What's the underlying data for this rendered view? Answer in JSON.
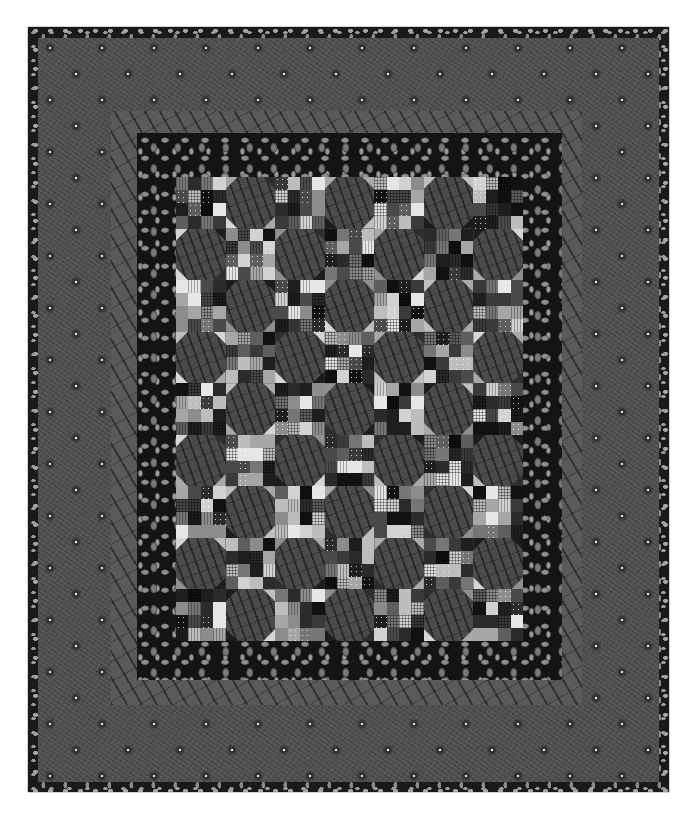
{
  "image": {
    "subject": "quilt",
    "description": "Scrappy patchwork quilt of alternating four-patch style blocks and snowball blocks, surrounded by a dark leaf-print border, a gray branch-print inner border, a wide gray paisley-dot outer border, and dark leaf-print binding",
    "colors": {
      "background": "#ffffff",
      "binding": "#1a1a1a",
      "outer_border": "#525252",
      "outer_border_dots": "#e4e4e4",
      "inner_border": "#5a5a5a",
      "leaf_border": "#141414",
      "snowball": "#4b4b4b"
    },
    "layout": {
      "grid_columns": 7,
      "grid_rows": 9
    },
    "blocks": [
      "P",
      "S",
      "P",
      "S",
      "P",
      "S",
      "P",
      "S",
      "P",
      "S",
      "P",
      "S",
      "P",
      "S",
      "P",
      "S",
      "P",
      "S",
      "P",
      "S",
      "P",
      "S",
      "P",
      "S",
      "P",
      "S",
      "P",
      "S",
      "P",
      "S",
      "P",
      "S",
      "P",
      "S",
      "P",
      "S",
      "P",
      "S",
      "P",
      "S",
      "P",
      "S",
      "P",
      "S",
      "P",
      "S",
      "P",
      "S",
      "P",
      "S",
      "P",
      "S",
      "P",
      "S",
      "P",
      "S",
      "P",
      "S",
      "P",
      "S",
      "P",
      "S",
      "P"
    ],
    "patch_palette": [
      "#111111",
      "#1e1e1e",
      "#2b2b2b",
      "#3a3a3a",
      "#4a4a4a",
      "#5e5e5e",
      "#767676",
      "#8c8c8c",
      "#a6a6a6",
      "#bdbdbd",
      "#d2d2d2",
      "#e6e6e6"
    ],
    "corner_palette": [
      "#bfbfbf",
      "#a9a9a9",
      "#d6d6d6",
      "#8f8f8f",
      "#1c1c1c",
      "#2e2e2e"
    ]
  }
}
